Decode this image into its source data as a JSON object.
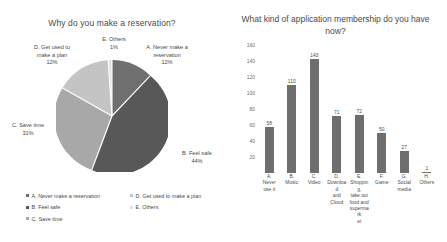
{
  "pie_panel": {
    "title": "Why do you make a reservation?",
    "labels": {
      "a": "A. Never make a\nreservation\n12%",
      "b": "B. Feel safe\n44%",
      "c": "C. Save time\n31%",
      "d": "D. Get used to\nmake a plan\n12%",
      "e": "E. Others\n1%"
    },
    "legend_left": [
      "A. Never make a reservation",
      "B. Feel safe",
      "C. Save time"
    ],
    "legend_right": [
      "D. Get used to make a plan",
      "E. Others"
    ]
  },
  "bar_panel": {
    "title": "What kind of application membership do you have now?"
  },
  "chart_data": [
    {
      "type": "pie",
      "title": "Why do you make a reservation?",
      "legend_position": "bottom",
      "categories": [
        "A. Never make a reservation",
        "B. Feel safe",
        "C. Save time",
        "D. Get used to make a plan",
        "E. Others"
      ],
      "values": [
        12,
        44,
        31,
        12,
        1
      ],
      "value_unit": "%",
      "data_labels": [
        "12%",
        "44%",
        "31%",
        "12%",
        "1%"
      ],
      "colors": [
        "#6f6f6f",
        "#585858",
        "#a8a8a8",
        "#c4c4c4",
        "#e2e2e2"
      ]
    },
    {
      "type": "bar",
      "title": "What kind of application membership do you have now?",
      "xlabel": "",
      "ylabel": "",
      "ylim": [
        0,
        160
      ],
      "yticks": [
        160,
        140,
        120,
        100,
        80,
        60,
        40,
        20
      ],
      "grid": false,
      "bar_color": "#6e6e6e",
      "categories": [
        "A. Never use it",
        "B. Music",
        "C. Video",
        "D. Download and Cloud",
        "E. Shopping, take out food and supermarket",
        "F. Game",
        "G. Social media",
        "H. Others"
      ],
      "category_lines": [
        [
          "A.",
          "Never",
          "use it"
        ],
        [
          "B.",
          "Music"
        ],
        [
          "C.",
          "Video"
        ],
        [
          "D.",
          "Download",
          "and Cloud"
        ],
        [
          "E.",
          "Shopping,",
          "take out",
          "food and",
          "supermark",
          "et"
        ],
        [
          "F.",
          "Game"
        ],
        [
          "G.",
          "Social",
          "media"
        ],
        [
          "H.",
          "Others"
        ]
      ],
      "values": [
        58,
        110,
        143,
        71,
        72,
        50,
        27,
        1
      ],
      "data_labels": [
        "58",
        "110",
        "143",
        "71",
        "72",
        "50",
        "27",
        "1"
      ]
    }
  ]
}
